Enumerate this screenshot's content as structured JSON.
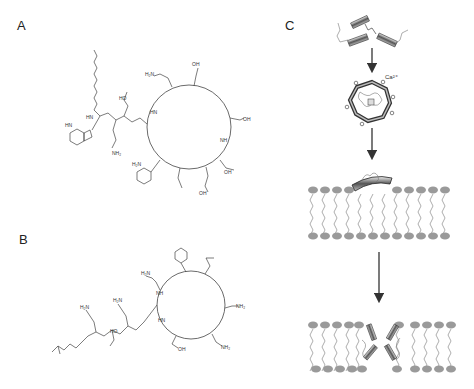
{
  "figure": {
    "panels": [
      {
        "id": "A",
        "label": "A",
        "description": "Daptomycin chemical structure: cyclic lipopeptide with decanoyl tail, Trp, Asn, Asp residues and macrolactone ring",
        "groups": [
          "HN",
          "HO",
          "O",
          "NH2",
          "H2N",
          "OH",
          "NH",
          "HN",
          "O",
          "OH"
        ]
      },
      {
        "id": "B",
        "label": "B",
        "description": "Polymyxin chemical structure: cyclic heptapeptide with Dab residues, Phe, Leu, Thr and fatty acyl tail",
        "groups": [
          "H2N",
          "H2N",
          "H2N",
          "NH2",
          "NH2",
          "OH",
          "HO",
          "NH",
          "HN"
        ]
      },
      {
        "id": "C",
        "label": "C",
        "description": "Mechanism: monomers oligomerize with calcium, insert into membrane, form pore",
        "ion_label": "Ca²⁺",
        "steps": [
          "monomers",
          "Ca-bound oligomer",
          "membrane insertion",
          "pore formation"
        ]
      }
    ],
    "colors": {
      "lipid_head": "#9a9a9a",
      "lipid_tail": "#777777",
      "line": "#444444",
      "background": "#ffffff"
    }
  }
}
